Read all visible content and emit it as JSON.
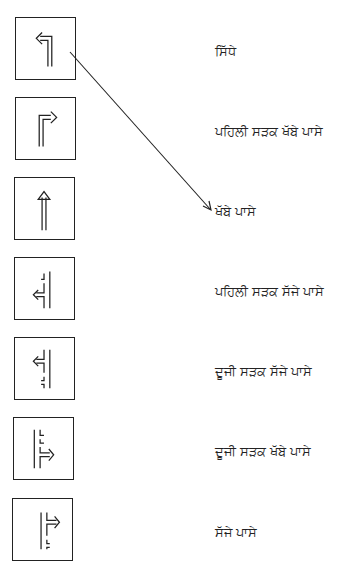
{
  "page": {
    "header_fragment": "",
    "stroke_color": "#222222",
    "background": "#ffffff"
  },
  "signs": [
    {
      "icon": "turn-left-arrow-icon",
      "label": "ਸਿੱਧੇ"
    },
    {
      "icon": "turn-right-arrow-icon",
      "label": "ਪਹਿਲੀ ਸੜਕ ਖੱਬੇ ਪਾਸੇ"
    },
    {
      "icon": "straight-arrow-icon",
      "label": "ਖੱਬੇ ਪਾਸੇ"
    },
    {
      "icon": "first-left-road-arrow-icon",
      "label": "ਪਹਿਲੀ ਸੜਕ ਸੱਜੇ ਪਾਸੇ"
    },
    {
      "icon": "second-left-road-arrow-icon",
      "label": "ਦੂਜੀ ਸੜਕ ਸੱਜੇ ਪਾਸੇ"
    },
    {
      "icon": "second-right-road-arrow-icon",
      "label": "ਦੂਜੀ ਸੜਕ ਖੱਬੇ ਪਾਸੇ"
    },
    {
      "icon": "first-right-road-arrow-icon",
      "label": "ਸੱਜੇ ਪਾਸੇ"
    }
  ],
  "connector": {
    "from_sign": 0,
    "to_label": 2,
    "description": "matching-line-arrow"
  }
}
